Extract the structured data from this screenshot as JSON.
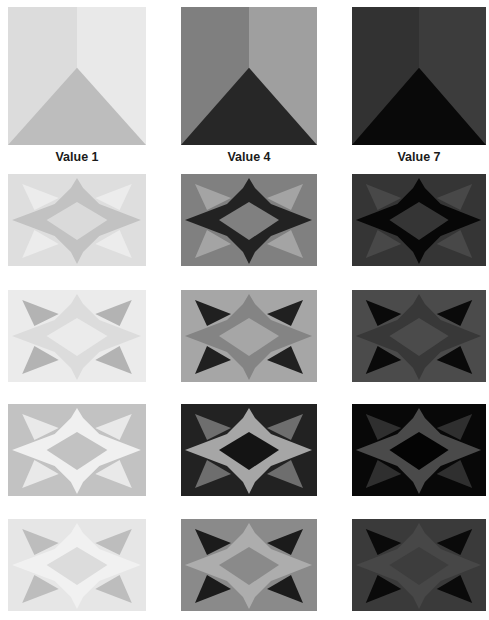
{
  "figure": {
    "labels": [
      "Value 1",
      "Value 4",
      "Value 7"
    ],
    "columns_x": [
      8,
      181,
      352
    ],
    "column_widths": [
      138,
      136,
      134
    ]
  },
  "corner_row": {
    "y": 7,
    "height": 138,
    "panels": [
      {
        "left_face": "#dcdcdc",
        "right_face": "#e9e9e9",
        "triangle": "#bdbdbd"
      },
      {
        "left_face": "#7f7f7f",
        "right_face": "#9f9f9f",
        "triangle": "#272727"
      },
      {
        "left_face": "#323232",
        "right_face": "#3c3c3c",
        "triangle": "#090909"
      }
    ]
  },
  "star_rows": [
    {
      "y": 174,
      "height": 92,
      "panels": [
        {
          "background": "#dedede",
          "star": "#c2c2c2",
          "diamond": "#dadada",
          "triangles": "#ececec"
        },
        {
          "background": "#808080",
          "star": "#222222",
          "diamond": "#808080",
          "triangles": "#a4a4a4"
        },
        {
          "background": "#353535",
          "star": "#070707",
          "diamond": "#353535",
          "triangles": "#484848"
        }
      ]
    },
    {
      "y": 290,
      "height": 92,
      "panels": [
        {
          "background": "#ebebeb",
          "star": "#dcdcdc",
          "diamond": "#ebebeb",
          "triangles": "#b3b3b3"
        },
        {
          "background": "#a6a6a6",
          "star": "#848484",
          "diamond": "#a6a6a6",
          "triangles": "#202020"
        },
        {
          "background": "#4b4b4b",
          "star": "#383838",
          "diamond": "#4b4b4b",
          "triangles": "#0a0a0a"
        }
      ]
    },
    {
      "y": 404,
      "height": 92,
      "panels": [
        {
          "background": "#c2c2c2",
          "star": "#f0f0f0",
          "diamond": "#c2c2c2",
          "triangles": "#e9e9e9"
        },
        {
          "background": "#222222",
          "star": "#a6a6a6",
          "diamond": "#141414",
          "triangles": "#6e6e6e"
        },
        {
          "background": "#080808",
          "star": "#4a4a4a",
          "diamond": "#040404",
          "triangles": "#2f2f2f"
        }
      ]
    },
    {
      "y": 519,
      "height": 92,
      "panels": [
        {
          "background": "#e6e6e6",
          "star": "#f1f1f1",
          "diamond": "#dcdcdc",
          "triangles": "#bdbdbd"
        },
        {
          "background": "#8a8a8a",
          "star": "#adadad",
          "diamond": "#8a8a8a",
          "triangles": "#1b1b1b"
        },
        {
          "background": "#3a3a3a",
          "star": "#474747",
          "diamond": "#3d3d3d",
          "triangles": "#0a0a0a"
        }
      ]
    }
  ]
}
